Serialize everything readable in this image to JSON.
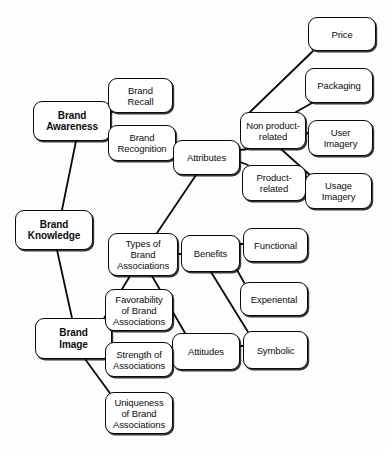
{
  "diagram": {
    "background_color": "#fdfdfc",
    "line_color": "#0a0a0a",
    "nodes": [
      {
        "id": "brand_awareness",
        "label": "Brand\nAwareness",
        "x": 33,
        "y": 101,
        "w": 78,
        "h": 40,
        "bold": true
      },
      {
        "id": "brand_knowledge",
        "label": "Brand\nKnowledge",
        "x": 15,
        "y": 210,
        "w": 78,
        "h": 40,
        "bold": true
      },
      {
        "id": "brand_image",
        "label": "Brand\nImage",
        "x": 35,
        "y": 318,
        "w": 77,
        "h": 41,
        "bold": true
      },
      {
        "id": "brand_recall",
        "label": "Brand\nRecall",
        "x": 108,
        "y": 78,
        "w": 65,
        "h": 35,
        "bold": false
      },
      {
        "id": "brand_recognition",
        "label": "Brand\nRecognition",
        "x": 108,
        "y": 125,
        "w": 68,
        "h": 36,
        "bold": false
      },
      {
        "id": "attributes",
        "label": "Attributes",
        "x": 173,
        "y": 140,
        "w": 67,
        "h": 35,
        "bold": false
      },
      {
        "id": "non_product",
        "label": "Non product-\nrelated",
        "x": 240,
        "y": 112,
        "w": 66,
        "h": 37,
        "bold": false
      },
      {
        "id": "product_related",
        "label": "Product-\nrelated",
        "x": 242,
        "y": 165,
        "w": 64,
        "h": 36,
        "bold": false
      },
      {
        "id": "price",
        "label": "Price",
        "x": 308,
        "y": 17,
        "w": 68,
        "h": 34,
        "bold": false
      },
      {
        "id": "packaging",
        "label": "Packaging",
        "x": 305,
        "y": 68,
        "w": 68,
        "h": 35,
        "bold": false
      },
      {
        "id": "user_imagery",
        "label": "User\nImagery",
        "x": 308,
        "y": 120,
        "w": 65,
        "h": 36,
        "bold": false
      },
      {
        "id": "usage_imagery",
        "label": "Usage\nImagery",
        "x": 305,
        "y": 173,
        "w": 67,
        "h": 36,
        "bold": false
      },
      {
        "id": "types_assoc",
        "label": "Types of\nBrand\nAssociations",
        "x": 108,
        "y": 233,
        "w": 70,
        "h": 43,
        "bold": false
      },
      {
        "id": "benefits",
        "label": "Benefits",
        "x": 181,
        "y": 235,
        "w": 59,
        "h": 37,
        "bold": false
      },
      {
        "id": "functional",
        "label": "Functional",
        "x": 243,
        "y": 228,
        "w": 65,
        "h": 34,
        "bold": false
      },
      {
        "id": "experiental",
        "label": "Experiental",
        "x": 240,
        "y": 282,
        "w": 68,
        "h": 34,
        "bold": false
      },
      {
        "id": "symbolic",
        "label": "Symbolic",
        "x": 243,
        "y": 331,
        "w": 65,
        "h": 38,
        "bold": false
      },
      {
        "id": "attitudes",
        "label": "Attitudes",
        "x": 172,
        "y": 333,
        "w": 68,
        "h": 37,
        "bold": false
      },
      {
        "id": "favorability",
        "label": "Favorability\nof Brand\nAssociations",
        "x": 105,
        "y": 289,
        "w": 68,
        "h": 42,
        "bold": false
      },
      {
        "id": "strength",
        "label": "Strength of\nAssociations",
        "x": 105,
        "y": 342,
        "w": 68,
        "h": 35,
        "bold": false
      },
      {
        "id": "uniqueness",
        "label": "Uniqueness\nof Brand\nAssociations",
        "x": 105,
        "y": 392,
        "w": 68,
        "h": 42,
        "bold": false
      }
    ],
    "edges": [
      {
        "from": "brand_knowledge",
        "to": "brand_awareness",
        "path": "M 62,210 L 76,141"
      },
      {
        "from": "brand_knowledge",
        "to": "brand_image",
        "path": "M 57,250 L 72,318"
      },
      {
        "from": "brand_awareness",
        "to": "brand_recall",
        "path": "M 111,113 L 119,105"
      },
      {
        "from": "brand_awareness",
        "to": "brand_recognition",
        "path": "M 111,131 L 119,137"
      },
      {
        "from": "brand_image",
        "to": "types_assoc",
        "path": "M 103,320 L 130,276"
      },
      {
        "from": "brand_image",
        "to": "favorability",
        "path": "M 112,327 L 123,331"
      },
      {
        "from": "brand_image",
        "to": "strength",
        "path": "M 112,350 L 123,345"
      },
      {
        "from": "brand_image",
        "to": "uniqueness",
        "path": "M 85,359 L 112,396"
      },
      {
        "from": "types_assoc",
        "to": "attributes",
        "path": "M 157,233 L 196,175"
      },
      {
        "from": "types_assoc",
        "to": "benefits",
        "path": "M 178,254 L 181,254"
      },
      {
        "from": "types_assoc",
        "to": "attitudes",
        "path": "M 152,276 L 185,333"
      },
      {
        "from": "attributes",
        "to": "non_product",
        "path": "M 240,150 L 248,149"
      },
      {
        "from": "attributes",
        "to": "product_related",
        "path": "M 240,162 L 248,165"
      },
      {
        "from": "non_product",
        "to": "price",
        "path": "M 250,112 L 313,51"
      },
      {
        "from": "non_product",
        "to": "packaging",
        "path": "M 296,112 L 312,103"
      },
      {
        "from": "non_product",
        "to": "user_imagery",
        "path": "M 306,133 L 311,134"
      },
      {
        "from": "non_product",
        "to": "usage_imagery",
        "path": "M 281,149 L 311,176"
      },
      {
        "from": "benefits",
        "to": "functional",
        "path": "M 240,244 L 248,244"
      },
      {
        "from": "benefits",
        "to": "experiental",
        "path": "M 237,270 L 246,286"
      },
      {
        "from": "benefits",
        "to": "symbolic",
        "path": "M 211,272 L 248,332"
      },
      {
        "from": "attitudes",
        "to": "symbolic",
        "path": "M 240,346 L 247,346"
      }
    ]
  }
}
